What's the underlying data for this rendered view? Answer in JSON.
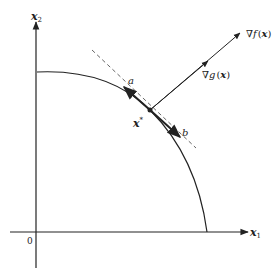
{
  "diagram": {
    "axes": {
      "x_label": "x",
      "x_sub": "1",
      "y_label": "x",
      "y_sub": "2",
      "origin_label": "0"
    },
    "point": {
      "label": "x",
      "superscript": "*"
    },
    "tangent_labels": {
      "a": "a",
      "b": "b"
    },
    "gradients": {
      "grad_f": {
        "nabla": "∇",
        "fn": "f",
        "open": "(",
        "arg": "x",
        "close": ")"
      },
      "grad_g": {
        "nabla": "∇",
        "fn": "g",
        "open": "(",
        "arg": "x",
        "close": ")"
      }
    },
    "colors": {
      "stroke": "#222222",
      "background": "#ffffff"
    }
  }
}
